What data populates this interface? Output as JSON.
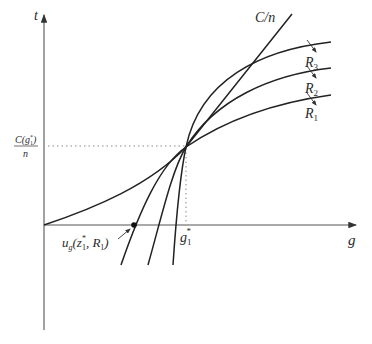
{
  "figure": {
    "axes": {
      "y_label": "t",
      "x_label": "g"
    },
    "curves": {
      "cost_line": "C/n",
      "r3": {
        "base": "R",
        "sub": "3"
      },
      "r2": {
        "base": "R",
        "sub": "2"
      },
      "r1": {
        "base": "R",
        "sub": "1"
      }
    },
    "y_marker": {
      "numerator": "C(g",
      "numerator_sub": "1",
      "numerator_sup": "*",
      "numerator_close": ")",
      "denominator": "n"
    },
    "x_marker": {
      "base": "g",
      "sub": "1",
      "sup": "*"
    },
    "point_annotation": {
      "func": "u",
      "func_sub": "g",
      "open": "(z",
      "z_sub": "1",
      "z_sup": "*",
      "sep": ", R",
      "r_sub": "1",
      "close": ")"
    },
    "colors": {
      "ink": "#2a2a2a",
      "axis": "#555555",
      "dotted": "#888888"
    }
  }
}
